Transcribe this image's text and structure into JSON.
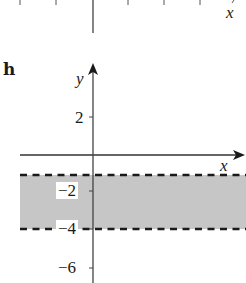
{
  "top_fragment": {
    "x_axis_label": "x",
    "tick_x_positions": [
      20,
      56,
      128,
      164,
      200
    ]
  },
  "panel": {
    "label": "h",
    "x_axis_label": "x",
    "y_axis_label": "y",
    "y_ticks": [
      {
        "value": 2,
        "label": "2"
      },
      {
        "value": -2,
        "label": "−2"
      },
      {
        "value": -4,
        "label": "−4"
      },
      {
        "value": -6,
        "label": "−6"
      }
    ],
    "region": {
      "description": "-4 < y < -1 (shaded band, dashed boundaries)",
      "lower": -4,
      "upper": -1,
      "boundary_style": "dashed",
      "fill_color": "#c6c6c6"
    },
    "colors": {
      "axis": "#333333",
      "dash": "#1a1a1a",
      "fill": "#c6c6c6"
    }
  }
}
